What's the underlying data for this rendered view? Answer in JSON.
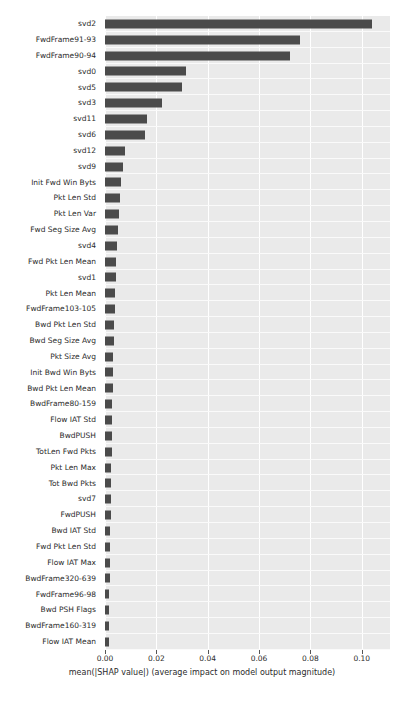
{
  "chart_data": {
    "type": "bar",
    "orientation": "horizontal",
    "title": "",
    "xlabel": "mean(|SHAP value|) (average impact on model output magnitude)",
    "ylabel": "",
    "xlim": [
      0.0,
      0.111
    ],
    "xticks": [
      0.0,
      0.02,
      0.04,
      0.06,
      0.08,
      0.1
    ],
    "xtick_labels": [
      "0.00",
      "0.02",
      "0.04",
      "0.06",
      "0.08",
      "0.10"
    ],
    "grid": "white gridlines on light gray panel",
    "legend": "none",
    "bar_color": "#4b4b4b",
    "panel_color": "#eaeaea",
    "gridline_color": "#ffffff",
    "categories": [
      "svd2",
      "FwdFrame91-93",
      "FwdFrame90-94",
      "svd0",
      "svd5",
      "svd3",
      "svd11",
      "svd6",
      "svd12",
      "svd9",
      "Init Fwd Win Byts",
      "Pkt Len Std",
      "Pkt Len Var",
      "Fwd Seg Size Avg",
      "svd4",
      "Fwd Pkt Len Mean",
      "svd1",
      "Pkt Len Mean",
      "FwdFrame103-105",
      "Bwd Pkt Len Std",
      "Bwd Seg Size Avg",
      "Pkt Size Avg",
      "Init Bwd Win Byts",
      "Bwd Pkt Len Mean",
      "BwdFrame80-159",
      "Flow IAT Std",
      "BwdPUSH",
      "TotLen Fwd Pkts",
      "Pkt Len Max",
      "Tot Bwd Pkts",
      "svd7",
      "FwdPUSH",
      "Bwd IAT Std",
      "Fwd Pkt Len Std",
      "Flow IAT Max",
      "BwdFrame320-639",
      "FwdFrame96-98",
      "Bwd PSH Flags",
      "BwdFrame160-319",
      "Flow IAT Mean"
    ],
    "values": [
      0.104,
      0.076,
      0.072,
      0.0315,
      0.03,
      0.0222,
      0.0163,
      0.0155,
      0.0078,
      0.007,
      0.0062,
      0.0058,
      0.0055,
      0.0052,
      0.0045,
      0.0043,
      0.0042,
      0.004,
      0.0037,
      0.0035,
      0.0034,
      0.0033,
      0.0032,
      0.003,
      0.0029,
      0.0028,
      0.0027,
      0.0026,
      0.0025,
      0.0024,
      0.0023,
      0.0022,
      0.0021,
      0.002,
      0.0019,
      0.0018,
      0.0017,
      0.0016,
      0.0015,
      0.0014
    ]
  }
}
